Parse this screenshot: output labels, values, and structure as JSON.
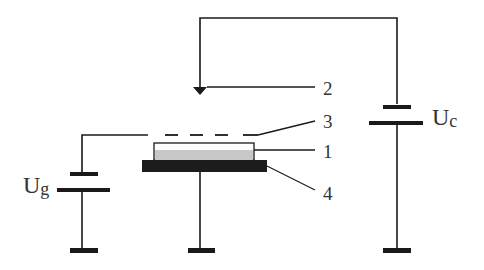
{
  "diagram": {
    "type": "circuit-schematic",
    "colors": {
      "line": "#1a1a1a",
      "substrate": "#1c1c1c",
      "film": "#c8c8c8",
      "label": "#333333",
      "background": "#ffffff"
    },
    "labels": {
      "item_1": "1",
      "item_2": "2",
      "item_3": "3",
      "item_4": "4",
      "uc_main": "U",
      "uc_sub": "c",
      "ug_main": "U",
      "ug_sub": "g"
    },
    "components": [
      {
        "id": "1",
        "description": "sample film layer"
      },
      {
        "id": "2",
        "description": "probe / collector electrode"
      },
      {
        "id": "3",
        "description": "grid electrode (dashed)"
      },
      {
        "id": "4",
        "description": "substrate holder"
      },
      {
        "id": "Uc",
        "description": "collector voltage source"
      },
      {
        "id": "Ug",
        "description": "grid voltage source"
      }
    ]
  }
}
